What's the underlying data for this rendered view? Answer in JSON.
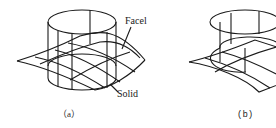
{
  "figure": {
    "panels": [
      {
        "id": "a",
        "caption": "（a）",
        "labels": {
          "facet": "Facel",
          "solid": "Solid"
        }
      },
      {
        "id": "b",
        "caption": "(b)"
      }
    ],
    "colors": {
      "stroke": "#1a1a1a",
      "background": "#ffffff"
    }
  }
}
